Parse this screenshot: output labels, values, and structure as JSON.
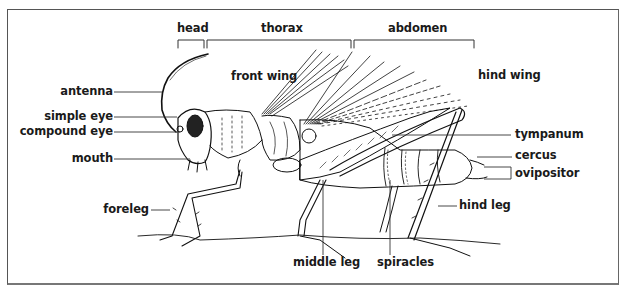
{
  "diagram": {
    "type": "labeled-anatomy",
    "segments": [
      {
        "label": "head",
        "x_start": 178,
        "x_end": 204
      },
      {
        "label": "thorax",
        "x_start": 207,
        "x_end": 351
      },
      {
        "label": "abdomen",
        "x_start": 354,
        "x_end": 474
      }
    ],
    "labels_left": [
      {
        "label": "antenna"
      },
      {
        "label": "simple eye"
      },
      {
        "label": "compound eye"
      },
      {
        "label": "mouth"
      },
      {
        "label": "foreleg"
      }
    ],
    "labels_inner": [
      {
        "label": "front wing"
      },
      {
        "label": "hind wing"
      }
    ],
    "labels_right": [
      {
        "label": "tympanum"
      },
      {
        "label": "cercus"
      },
      {
        "label": "ovipositor"
      },
      {
        "label": "hind leg"
      }
    ],
    "labels_bottom": [
      {
        "label": "middle leg"
      },
      {
        "label": "spiracles"
      }
    ]
  }
}
